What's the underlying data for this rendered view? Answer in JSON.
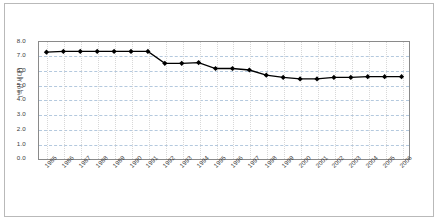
{
  "chart_data": {
    "type": "line",
    "title": "",
    "subtitle": "",
    "xlabel": "",
    "ylabel": "(백만 세대)",
    "categories": [
      "1985",
      "1986",
      "1987",
      "1988",
      "1989",
      "1990",
      "1991",
      "1992",
      "1993",
      "1994",
      "1995",
      "1996",
      "1997",
      "1998",
      "1999",
      "2000",
      "2001",
      "2002",
      "2003",
      "2004",
      "2005",
      "2006"
    ],
    "values": [
      7.25,
      7.3,
      7.3,
      7.3,
      7.3,
      7.3,
      7.3,
      6.5,
      6.5,
      6.55,
      6.15,
      6.15,
      6.05,
      5.7,
      5.55,
      5.45,
      5.45,
      5.55,
      5.55,
      5.6,
      5.6,
      5.6
    ],
    "series": [
      {
        "name": "series-1",
        "values": [
          7.25,
          7.3,
          7.3,
          7.3,
          7.3,
          7.3,
          7.3,
          6.5,
          6.5,
          6.55,
          6.15,
          6.15,
          6.05,
          5.7,
          5.55,
          5.45,
          5.45,
          5.55,
          5.55,
          5.6,
          5.6,
          5.6
        ]
      }
    ],
    "ylim": [
      0.0,
      8.0
    ],
    "ytick_labels": [
      "8.0",
      "7.0",
      "6.0",
      "5.0",
      "4.0",
      "3.0",
      "2.0",
      "1.0",
      "0.0"
    ],
    "ytick_values": [
      8.0,
      7.0,
      6.0,
      5.0,
      4.0,
      3.0,
      2.0,
      1.0,
      0.0
    ],
    "grid": true,
    "grid_style": "horizontal-dashed",
    "legend": false,
    "legend_position": "none",
    "marker": "diamond",
    "marker_color": "#000000",
    "line_color": "#000000",
    "gridline_color": "#9bb7d4",
    "axis_color": "#8a8a8a",
    "border_color": "#b9b9b9",
    "background": "#ffffff",
    "xtick_rotation": -45,
    "annotations": []
  }
}
